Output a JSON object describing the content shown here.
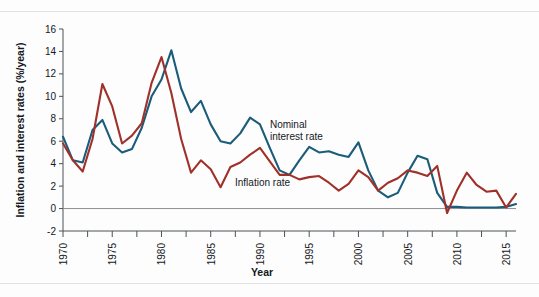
{
  "figure": {
    "background_color": "#fdfdfd",
    "rule_color": "#dfe3e6"
  },
  "chart_data": {
    "type": "line",
    "title": "",
    "subtitle": "",
    "xlabel": "Year",
    "ylabel": "Inflation and interest rates (%/year)",
    "xlim": [
      1970,
      2016
    ],
    "ylim": [
      -2,
      16
    ],
    "ytick_step": 2,
    "xtick_major_step": 5,
    "xtick_minor_step": 2.5,
    "grid": false,
    "legend": "inline-annotations",
    "ytick_labels": [
      "-2",
      "0",
      "2",
      "4",
      "6",
      "8",
      "10",
      "12",
      "14",
      "16"
    ],
    "ytick_values": [
      -2,
      0,
      2,
      4,
      6,
      8,
      10,
      12,
      14,
      16
    ],
    "xtick_labels": [
      "1970",
      "1975",
      "1980",
      "1985",
      "1990",
      "1995",
      "2000",
      "2005",
      "2010",
      "2015"
    ],
    "xtick_values": [
      1970,
      1975,
      1980,
      1985,
      1990,
      1995,
      2000,
      2005,
      2010,
      2015
    ],
    "x": [
      1970,
      1971,
      1972,
      1973,
      1974,
      1975,
      1976,
      1977,
      1978,
      1979,
      1980,
      1981,
      1982,
      1983,
      1984,
      1985,
      1986,
      1987,
      1988,
      1989,
      1990,
      1991,
      1992,
      1993,
      1994,
      1995,
      1996,
      1997,
      1998,
      1999,
      2000,
      2001,
      2002,
      2003,
      2004,
      2005,
      2006,
      2007,
      2008,
      2009,
      2010,
      2011,
      2012,
      2013,
      2014,
      2015,
      2016
    ],
    "series": [
      {
        "name": "Nominal interest rate",
        "color": "#1a5c7a",
        "annotation": "Nominal\ninterest rate",
        "values": [
          6.4,
          4.3,
          4.1,
          7.0,
          7.9,
          5.8,
          5.0,
          5.3,
          7.2,
          10.0,
          11.5,
          14.1,
          10.7,
          8.6,
          9.6,
          7.5,
          6.0,
          5.8,
          6.7,
          8.1,
          7.5,
          5.4,
          3.4,
          3.0,
          4.3,
          5.5,
          5.0,
          5.1,
          4.8,
          4.6,
          5.9,
          3.4,
          1.6,
          1.0,
          1.4,
          3.2,
          4.7,
          4.4,
          1.4,
          0.15,
          0.15,
          0.1,
          0.1,
          0.1,
          0.1,
          0.15,
          0.4
        ]
      },
      {
        "name": "Inflation rate",
        "color": "#a0312a",
        "annotation": "Inflation rate",
        "values": [
          5.8,
          4.3,
          3.3,
          6.2,
          11.1,
          9.1,
          5.8,
          6.5,
          7.6,
          11.2,
          13.5,
          10.3,
          6.2,
          3.2,
          4.3,
          3.5,
          1.9,
          3.7,
          4.1,
          4.8,
          5.4,
          4.2,
          3.0,
          3.0,
          2.6,
          2.8,
          2.9,
          2.3,
          1.6,
          2.2,
          3.4,
          2.8,
          1.6,
          2.3,
          2.7,
          3.4,
          3.2,
          2.9,
          3.8,
          -0.4,
          1.6,
          3.2,
          2.1,
          1.5,
          1.6,
          0.1,
          1.3
        ]
      }
    ]
  }
}
